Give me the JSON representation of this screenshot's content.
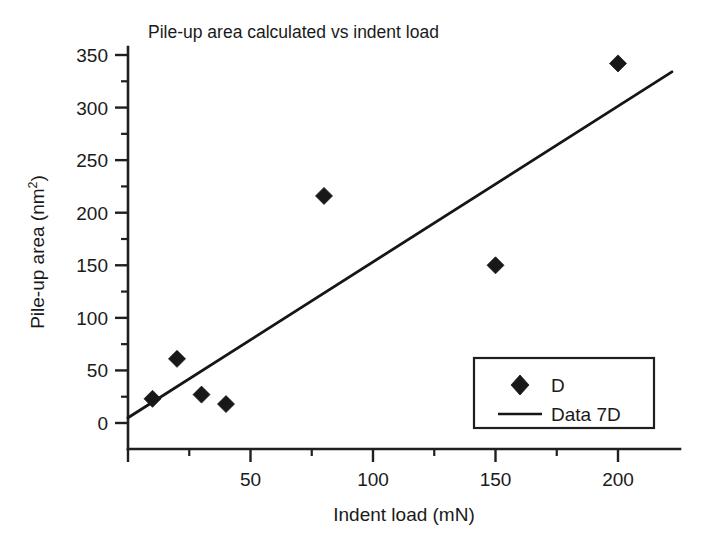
{
  "chart_data": {
    "type": "scatter",
    "title": "Pile-up area calculated vs indent load",
    "xlabel": "Indent load (mN)",
    "ylabel": "Pile-up area (nm2)",
    "ylabel_base": "Pile-up area (nm",
    "ylabel_sup": "2",
    "ylabel_close": ")",
    "xlim": [
      -8,
      228
    ],
    "ylim": [
      -30,
      372
    ],
    "grid": false,
    "legend_position": "lower-right",
    "x_ticks": [
      0,
      50,
      100,
      150,
      200
    ],
    "x_tick_labels": [
      "",
      "50",
      "100",
      "150",
      "200"
    ],
    "x_minor_ticks": [
      25,
      75,
      125,
      175
    ],
    "y_ticks": [
      0,
      50,
      100,
      150,
      200,
      250,
      300,
      350
    ],
    "y_tick_labels": [
      "0",
      "50",
      "100",
      "150",
      "200",
      "250",
      "300",
      "350"
    ],
    "y_minor_ticks": [
      25,
      75,
      125,
      175,
      225,
      275,
      325
    ],
    "series": [
      {
        "name": "D",
        "type": "scatter",
        "marker": "diamond",
        "color": "#181818",
        "x": [
          10,
          20,
          30,
          40,
          80,
          150,
          200
        ],
        "y": [
          23,
          61,
          27,
          18,
          216,
          150,
          342
        ],
        "points": [
          {
            "x": 10,
            "y": 23
          },
          {
            "x": 20,
            "y": 61
          },
          {
            "x": 30,
            "y": 27
          },
          {
            "x": 40,
            "y": 18
          },
          {
            "x": 80,
            "y": 216
          },
          {
            "x": 150,
            "y": 150
          },
          {
            "x": 200,
            "y": 342
          }
        ]
      },
      {
        "name": "Data 7D",
        "type": "line",
        "color": "#161616",
        "x": [
          0,
          222
        ],
        "y": [
          5,
          334
        ],
        "fit_intercept": 5,
        "fit_slope": 1.482
      }
    ],
    "legend_entries": [
      {
        "label": "D",
        "symbol": "diamond"
      },
      {
        "label": "Data 7D",
        "symbol": "line"
      }
    ]
  },
  "axis_titles": {
    "x": "Indent load (mN)",
    "y_base": "Pile-up area (nm",
    "y_sup": "2",
    "y_close": ")"
  },
  "colors": {
    "axis": "#1f1f1f",
    "marker": "#181818",
    "line": "#161616",
    "background": "#ffffff",
    "text": "#1a1a1a"
  }
}
